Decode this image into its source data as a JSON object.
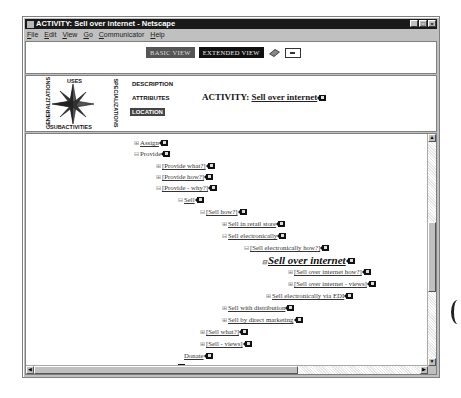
{
  "window": {
    "title": "ACTIVITY: Sell over internet - Netscape",
    "controls": [
      "minimize",
      "maximize",
      "close"
    ]
  },
  "menubar": [
    "File",
    "Edit",
    "View",
    "Go",
    "Communicator",
    "Help"
  ],
  "toolbar": {
    "basic_view": "BASIC VIEW",
    "extended_view": "EXTENDED VIEW",
    "icons": [
      "book-icon",
      "mail-icon"
    ]
  },
  "compass": {
    "top": "USES",
    "bottom": "SUBACTIVITIES",
    "left": "GENERALIZATIONS",
    "right": "SPECIALIZATIONS"
  },
  "nav": {
    "items": [
      {
        "label": "DESCRIPTION",
        "active": false
      },
      {
        "label": "ATTRIBUTES",
        "active": false
      },
      {
        "label": "LOCATION",
        "active": true
      }
    ]
  },
  "activity": {
    "prefix": "ACTIVITY:",
    "name": "Sell over internet"
  },
  "tree": [
    {
      "toggle": "⊞",
      "label": "Assign",
      "link": true
    },
    {
      "toggle": "⊟",
      "label": "Provide",
      "link": false
    },
    {
      "toggle": "⊞",
      "label": "[Provide what?]",
      "link": true
    },
    {
      "toggle": "⊞",
      "label": "[Provide how?]",
      "link": true
    },
    {
      "toggle": "⊟",
      "label": "[Provide - why?]",
      "link": true
    },
    {
      "toggle": "⊟",
      "label": "Sell",
      "link": true
    },
    {
      "toggle": "⊟",
      "label": "[Sell how?]",
      "link": true
    },
    {
      "toggle": "⊞",
      "label": "Sell in retail store",
      "link": true
    },
    {
      "toggle": "⊟",
      "label": "Sell electronically",
      "link": true
    },
    {
      "toggle": "⊟",
      "label": "[Sell electronically how?]",
      "link": true
    },
    {
      "toggle": "⊟",
      "label": "Sell over internet",
      "link": true,
      "current": true
    },
    {
      "toggle": "⊞",
      "label": "[Sell over internet how?]",
      "link": true
    },
    {
      "toggle": "⊞",
      "label": "[Sell over internet - views]",
      "link": true
    },
    {
      "toggle": "⊞",
      "label": "Sell electronically via EDI",
      "link": true
    },
    {
      "toggle": "⊞",
      "label": "Sell with distribution",
      "link": true
    },
    {
      "toggle": "⊞",
      "label": "Sell by direct marketing",
      "link": true
    },
    {
      "toggle": "⊞",
      "label": "[Sell what?]",
      "link": true
    },
    {
      "toggle": "⊞",
      "label": "[Sell - views]",
      "link": true
    },
    {
      "toggle": "",
      "label": "Donate",
      "link": true
    },
    {
      "toggle": "",
      "label": "[Give what?]",
      "link": true
    }
  ]
}
